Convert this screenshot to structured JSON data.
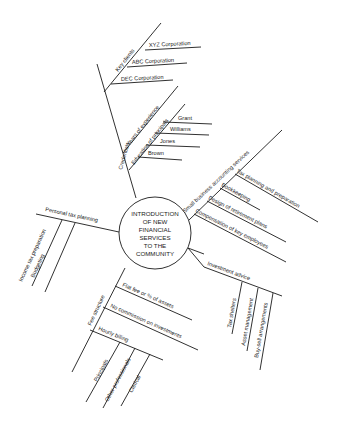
{
  "center": {
    "lines": [
      "INTRODUCTION",
      "OF NEW",
      "FINANCIAL",
      "SERVICES",
      "TO THE",
      "COMMUNITY"
    ]
  },
  "branches": {
    "credentials": {
      "label": "Credentials",
      "key_clients": {
        "label": "Key clients",
        "items": [
          "XYZ Corporation",
          "ABC Corporation",
          "DEC Corporation"
        ]
      },
      "years_experience": {
        "label": "Years of experience"
      },
      "education": {
        "label": "Education of principals",
        "items": [
          "Grant",
          "Williams",
          "Jones",
          "Brown"
        ]
      }
    },
    "small_business": {
      "label": "Small business accounting services",
      "items": [
        "Tax planning and preparation",
        "Bookkeeping",
        "Design of retirement plans",
        "Compensation of key employees"
      ]
    },
    "investment": {
      "label": "Investment advice",
      "items": [
        "Tax shelters",
        "Asset management",
        "Buy-sell arrangements"
      ]
    },
    "fee_structure": {
      "label": "Fee structure",
      "items": [
        "Flat fee or % of assets",
        "No commission on investments"
      ],
      "hourly": {
        "label": "Hourly billing",
        "items": [
          "Principals",
          "Other professionals",
          "Clerical"
        ]
      }
    },
    "personal_tax": {
      "label": "Personal tax planning",
      "items": [
        "Income tax preparation",
        "Budgeting"
      ]
    }
  }
}
